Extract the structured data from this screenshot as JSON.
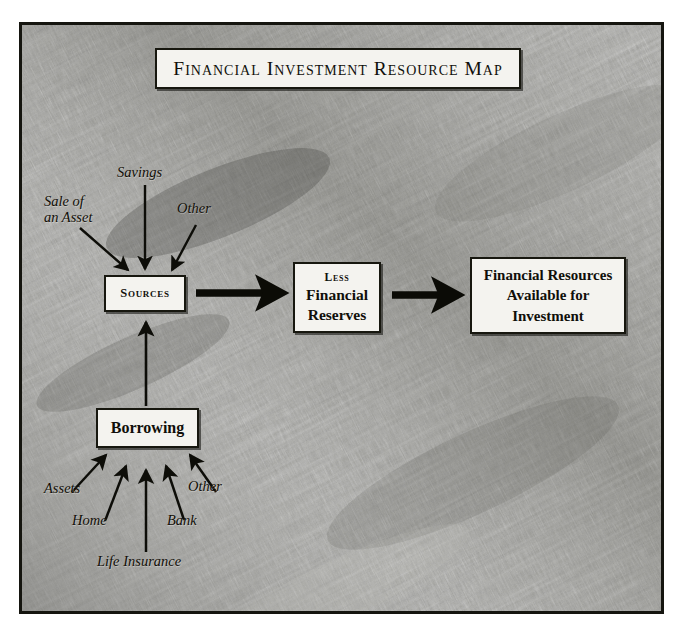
{
  "title": {
    "text": "Financial Investment Resource Map"
  },
  "boxes": {
    "sources": {
      "label": "Sources"
    },
    "reserves": {
      "less": "Less",
      "line1": "Financial",
      "line2": "Reserves"
    },
    "resources": {
      "line1": "Financial Resources",
      "line2": "Available for",
      "line3": "Investment"
    },
    "borrowing": {
      "label": "Borrowing"
    }
  },
  "source_inputs": [
    {
      "label": "Sale of an Asset",
      "line1": "Sale of",
      "line2": "an Asset"
    },
    {
      "label": "Savings"
    },
    {
      "label": "Other"
    }
  ],
  "borrowing_inputs": [
    {
      "label": "Assets"
    },
    {
      "label": "Home"
    },
    {
      "label": "Life Insurance"
    },
    {
      "label": "Bank"
    },
    {
      "label": "Other"
    }
  ],
  "colors": {
    "ink": "#100f0a",
    "box_fill": "#f4f3ef",
    "frame_border": "#15150f",
    "stone_light": "#b9b9b4",
    "stone_mid": "#8e8e89",
    "stone_dark": "#4f4f4c"
  }
}
